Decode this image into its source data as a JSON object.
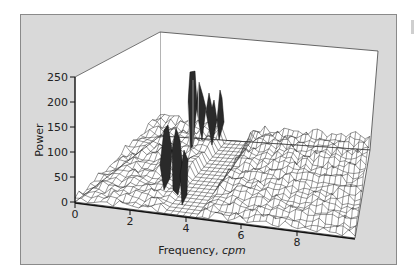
{
  "chart_data": {
    "type": "surface3d",
    "title": "",
    "xlabel": "Frequency, cpm",
    "xlabel_plain": "Frequency, ",
    "xlabel_italic": "cpm",
    "ylabel": "Power",
    "x_ticks": [
      "0",
      "2",
      "4",
      "6",
      "8"
    ],
    "y_ticks": [
      "0",
      "50",
      "100",
      "150",
      "200",
      "250"
    ],
    "xlim": [
      0,
      10
    ],
    "ylim": [
      0,
      250
    ],
    "depth_axis": "time (unlabeled)",
    "series": [
      {
        "name": "peak-ridge (approx max power vs frequency)",
        "x": [
          0,
          1,
          2,
          2.5,
          3,
          3.5,
          4,
          4.5,
          5,
          6,
          7,
          8,
          9,
          10
        ],
        "values": [
          20,
          35,
          60,
          75,
          130,
          250,
          240,
          200,
          210,
          60,
          55,
          50,
          50,
          45
        ]
      }
    ],
    "grid": false,
    "legend": null
  },
  "colors": {
    "panel_bg": "#d9d9d9",
    "plot_bg": "#ffffff",
    "mesh_line": "#333333",
    "peak_fill": "#2a2a2a"
  }
}
